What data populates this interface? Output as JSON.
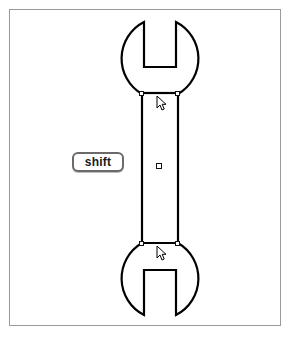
{
  "app": {
    "title": "Vector Shape Editor Canvas",
    "canvas_background": "#ffffff",
    "frame_border_color": "#9a9a9a"
  },
  "modifier_key_hint": {
    "label": "shift",
    "name": "shift-key-badge",
    "x": 62,
    "y": 142,
    "width": 52,
    "height": 20,
    "border_color": "#6a6a6a",
    "text_color": "#1a1a1a"
  },
  "shape": {
    "name": "wrench",
    "description": "Double open-ended spanner / wrench outline",
    "stroke_color": "#000000",
    "fill_color": "#ffffff",
    "stroke_width": 2,
    "head_top": {
      "center_x": 159,
      "center_y": 52,
      "radius": 41,
      "jaw_left_x": 134,
      "jaw_right_x": 159,
      "jaw_depth_y": 57
    },
    "head_bottom": {
      "center_x": 159,
      "center_y": 283,
      "radius": 41,
      "jaw_left_x": 134,
      "jaw_right_x": 159,
      "jaw_depth_y": 278
    },
    "shaft": {
      "left_x": 132,
      "right_x": 168,
      "top_y": 84,
      "bottom_y": 233,
      "width": 36,
      "height": 149
    }
  },
  "selection": {
    "state": "selected-resizing",
    "handle_fill": "#ffffff",
    "handle_stroke": "#111111",
    "handles": [
      {
        "name": "handle-top-left",
        "x": 130,
        "y": 82
      },
      {
        "name": "handle-top-right",
        "x": 166,
        "y": 82
      },
      {
        "name": "handle-center",
        "x": 146,
        "y": 153
      },
      {
        "name": "handle-bottom-left",
        "x": 130,
        "y": 231
      },
      {
        "name": "handle-bottom-right",
        "x": 166,
        "y": 231
      }
    ]
  },
  "cursors": [
    {
      "name": "cursor-arrow-upper",
      "x": 146,
      "y": 85
    },
    {
      "name": "cursor-arrow-lower",
      "x": 146,
      "y": 235
    }
  ]
}
